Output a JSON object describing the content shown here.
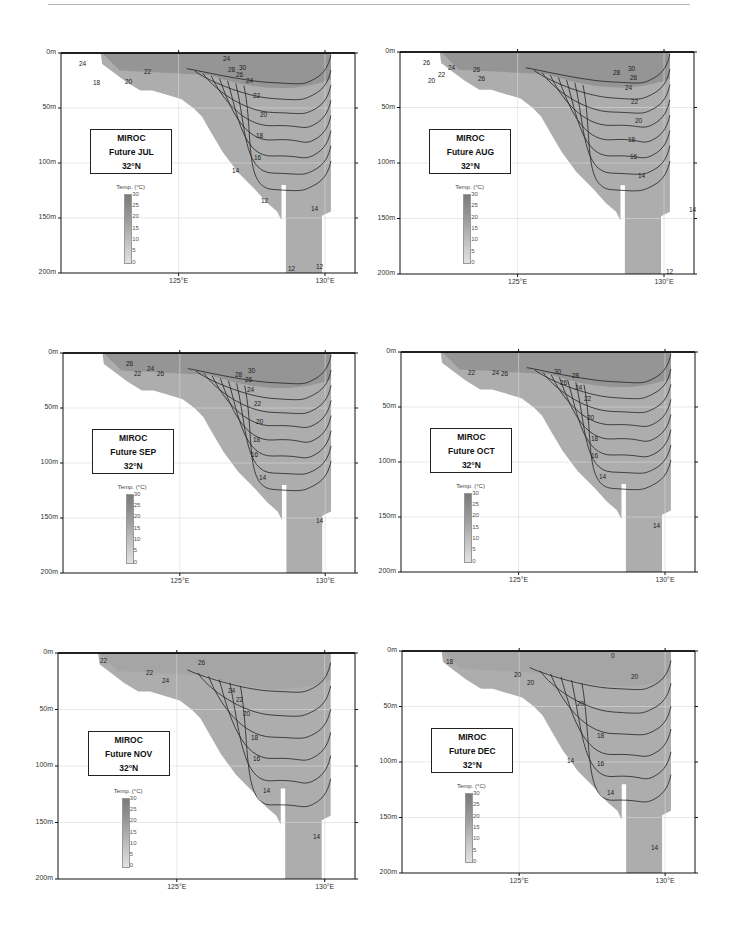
{
  "figure": {
    "colorbar": {
      "title": "Temp. (°C)",
      "ticks": [
        "30",
        "25",
        "20",
        "15",
        "10",
        "5",
        "0"
      ]
    },
    "y_ticks": [
      "0m",
      "50m",
      "100m",
      "150m",
      "200m"
    ],
    "x_ticks": [
      "125°E",
      "130°E"
    ],
    "panels": [
      {
        "id": "jul",
        "model": "MIROC",
        "period": "Future JUL",
        "lat": "32°N",
        "left": 61,
        "top": 53,
        "width": 294,
        "height": 220,
        "labels": [
          {
            "t": "24",
            "x": 162,
            "y": 5
          },
          {
            "t": "24",
            "x": 18,
            "y": 10
          },
          {
            "t": "22",
            "x": 83,
            "y": 18
          },
          {
            "t": "20",
            "x": 64,
            "y": 28
          },
          {
            "t": "18",
            "x": 32,
            "y": 29
          },
          {
            "t": "30",
            "x": 178,
            "y": 14
          },
          {
            "t": "28",
            "x": 167,
            "y": 16
          },
          {
            "t": "26",
            "x": 175,
            "y": 21
          },
          {
            "t": "24",
            "x": 185,
            "y": 27
          },
          {
            "t": "22",
            "x": 192,
            "y": 42
          },
          {
            "t": "20",
            "x": 199,
            "y": 61
          },
          {
            "t": "18",
            "x": 195,
            "y": 82
          },
          {
            "t": "16",
            "x": 193,
            "y": 104
          },
          {
            "t": "14",
            "x": 171,
            "y": 117
          },
          {
            "t": "12",
            "x": 200,
            "y": 147
          },
          {
            "t": "14",
            "x": 250,
            "y": 155
          },
          {
            "t": "12",
            "x": 227,
            "y": 215
          },
          {
            "t": "12",
            "x": 255,
            "y": 213
          }
        ]
      },
      {
        "id": "aug",
        "model": "MIROC",
        "period": "Future AUG",
        "lat": "32°N",
        "left": 400,
        "top": 52,
        "width": 294,
        "height": 222,
        "labels": [
          {
            "t": "26",
            "x": 23,
            "y": 10
          },
          {
            "t": "24",
            "x": 48,
            "y": 15
          },
          {
            "t": "22",
            "x": 38,
            "y": 22
          },
          {
            "t": "20",
            "x": 28,
            "y": 28
          },
          {
            "t": "26",
            "x": 73,
            "y": 17
          },
          {
            "t": "26",
            "x": 78,
            "y": 26
          },
          {
            "t": "30",
            "x": 228,
            "y": 16
          },
          {
            "t": "28",
            "x": 213,
            "y": 20
          },
          {
            "t": "26",
            "x": 230,
            "y": 25
          },
          {
            "t": "24",
            "x": 225,
            "y": 35
          },
          {
            "t": "22",
            "x": 231,
            "y": 49
          },
          {
            "t": "20",
            "x": 235,
            "y": 68
          },
          {
            "t": "18",
            "x": 228,
            "y": 87
          },
          {
            "t": "16",
            "x": 230,
            "y": 104
          },
          {
            "t": "14",
            "x": 238,
            "y": 123
          },
          {
            "t": "14",
            "x": 289,
            "y": 157
          },
          {
            "t": "12",
            "x": 266,
            "y": 219
          }
        ]
      },
      {
        "id": "sep",
        "model": "MIROC",
        "period": "Future SEP",
        "lat": "32°N",
        "left": 63,
        "top": 353,
        "width": 292,
        "height": 220,
        "labels": [
          {
            "t": "26",
            "x": 63,
            "y": 10
          },
          {
            "t": "24",
            "x": 84,
            "y": 15
          },
          {
            "t": "22",
            "x": 71,
            "y": 20
          },
          {
            "t": "26",
            "x": 94,
            "y": 20
          },
          {
            "t": "30",
            "x": 185,
            "y": 17
          },
          {
            "t": "28",
            "x": 172,
            "y": 21
          },
          {
            "t": "26",
            "x": 182,
            "y": 26
          },
          {
            "t": "24",
            "x": 184,
            "y": 36
          },
          {
            "t": "22",
            "x": 191,
            "y": 50
          },
          {
            "t": "20",
            "x": 193,
            "y": 68
          },
          {
            "t": "18",
            "x": 190,
            "y": 86
          },
          {
            "t": "16",
            "x": 188,
            "y": 101
          },
          {
            "t": "14",
            "x": 196,
            "y": 124
          },
          {
            "t": "14",
            "x": 253,
            "y": 167
          }
        ]
      },
      {
        "id": "oct",
        "model": "MIROC",
        "period": "Future OCT",
        "lat": "32°N",
        "left": 401,
        "top": 352,
        "width": 294,
        "height": 220,
        "labels": [
          {
            "t": "22",
            "x": 67,
            "y": 20
          },
          {
            "t": "24",
            "x": 91,
            "y": 20
          },
          {
            "t": "26",
            "x": 100,
            "y": 21
          },
          {
            "t": "30",
            "x": 153,
            "y": 19
          },
          {
            "t": "28",
            "x": 171,
            "y": 23
          },
          {
            "t": "26",
            "x": 159,
            "y": 30
          },
          {
            "t": "24",
            "x": 174,
            "y": 35
          },
          {
            "t": "22",
            "x": 183,
            "y": 46
          },
          {
            "t": "20",
            "x": 186,
            "y": 65
          },
          {
            "t": "18",
            "x": 190,
            "y": 86
          },
          {
            "t": "16",
            "x": 190,
            "y": 103
          },
          {
            "t": "14",
            "x": 198,
            "y": 124
          },
          {
            "t": "14",
            "x": 252,
            "y": 173
          }
        ]
      },
      {
        "id": "nov",
        "model": "MIROC",
        "period": "Future NOV",
        "lat": "32°N",
        "left": 58,
        "top": 653,
        "width": 297,
        "height": 226,
        "labels": [
          {
            "t": "22",
            "x": 42,
            "y": 7
          },
          {
            "t": "22",
            "x": 88,
            "y": 19
          },
          {
            "t": "24",
            "x": 104,
            "y": 27
          },
          {
            "t": "26",
            "x": 140,
            "y": 9
          },
          {
            "t": "24",
            "x": 170,
            "y": 37
          },
          {
            "t": "22",
            "x": 178,
            "y": 46
          },
          {
            "t": "20",
            "x": 185,
            "y": 60
          },
          {
            "t": "18",
            "x": 193,
            "y": 84
          },
          {
            "t": "16",
            "x": 195,
            "y": 105
          },
          {
            "t": "14",
            "x": 205,
            "y": 137
          },
          {
            "t": "14",
            "x": 255,
            "y": 183
          }
        ]
      },
      {
        "id": "dec",
        "model": "MIROC",
        "period": "Future DEC",
        "lat": "32°N",
        "left": 402,
        "top": 651,
        "width": 293,
        "height": 222,
        "labels": [
          {
            "t": "18",
            "x": 44,
            "y": 10
          },
          {
            "t": "20",
            "x": 112,
            "y": 23
          },
          {
            "t": "20",
            "x": 125,
            "y": 31
          },
          {
            "t": "20",
            "x": 175,
            "y": 52
          },
          {
            "t": "20",
            "x": 229,
            "y": 25
          },
          {
            "t": "0",
            "x": 209,
            "y": 4
          },
          {
            "t": "18",
            "x": 195,
            "y": 84
          },
          {
            "t": "16",
            "x": 195,
            "y": 112
          },
          {
            "t": "14",
            "x": 165,
            "y": 109
          },
          {
            "t": "14",
            "x": 205,
            "y": 141
          },
          {
            "t": "14",
            "x": 249,
            "y": 196
          }
        ]
      }
    ]
  },
  "chart_data": {
    "type": "heatmap",
    "xlabel": "Longitude",
    "ylabel": "Depth",
    "xlim": [
      "~121°E",
      "~131°E"
    ],
    "ylim": [
      "0m",
      "200m"
    ],
    "x_ticks": [
      "125°E",
      "130°E"
    ],
    "y_ticks": [
      "0m",
      "50m",
      "100m",
      "150m",
      "200m"
    ],
    "grid": true,
    "colorbar": {
      "label": "Temp. (°C)",
      "range": [
        0,
        30
      ],
      "ticks": [
        0,
        5,
        10,
        15,
        20,
        25,
        30
      ]
    },
    "contour_interval_degC": 2,
    "panels": [
      {
        "label": "MIROC Future JUL 32°N",
        "contour_labels": [
          30,
          28,
          26,
          24,
          22,
          20,
          18,
          16,
          14,
          12
        ]
      },
      {
        "label": "MIROC Future AUG 32°N",
        "contour_labels": [
          30,
          28,
          26,
          24,
          22,
          20,
          18,
          16,
          14,
          12
        ]
      },
      {
        "label": "MIROC Future SEP 32°N",
        "contour_labels": [
          30,
          28,
          26,
          24,
          22,
          20,
          18,
          16,
          14
        ]
      },
      {
        "label": "MIROC Future OCT 32°N",
        "contour_labels": [
          30,
          28,
          26,
          24,
          22,
          20,
          18,
          16,
          14
        ]
      },
      {
        "label": "MIROC Future NOV 32°N",
        "contour_labels": [
          26,
          24,
          22,
          20,
          18,
          16,
          14
        ]
      },
      {
        "label": "MIROC Future DEC 32°N",
        "contour_labels": [
          20,
          18,
          16,
          14
        ]
      }
    ]
  }
}
